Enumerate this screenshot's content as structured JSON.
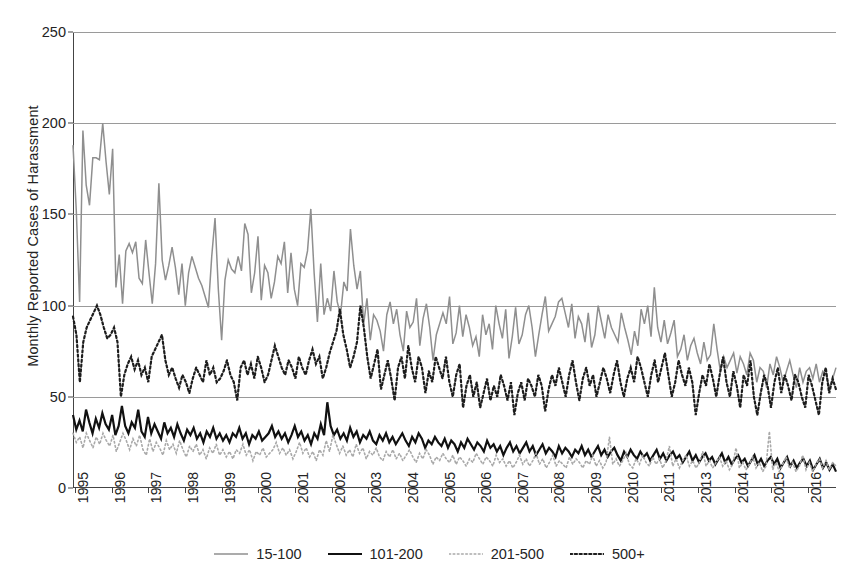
{
  "chart_data": {
    "type": "line",
    "title": "",
    "xlabel": "",
    "ylabel": "Monthly Reported Cases of Harassment",
    "ylim": [
      0,
      250
    ],
    "yticks": [
      0,
      50,
      100,
      150,
      200,
      250
    ],
    "grid": true,
    "legend_position": "bottom-center",
    "xtick_labels": [
      "1995",
      "1996",
      "1997",
      "1998",
      "1999",
      "2000",
      "2001",
      "2002",
      "2003",
      "2004",
      "2005",
      "2006",
      "2007",
      "2008",
      "2009",
      "2010",
      "2011",
      "2013",
      "2014",
      "2015",
      "2016"
    ],
    "x_start": 1995,
    "x_end": 2016.25,
    "x_unit": "month",
    "series": [
      {
        "name": "15-100",
        "color": "#8f8f8f",
        "style": "solid",
        "values": [
          188,
          152,
          102,
          196,
          166,
          155,
          181,
          181,
          180,
          200,
          179,
          161,
          186,
          110,
          128,
          101,
          130,
          134,
          129,
          135,
          115,
          112,
          136,
          118,
          101,
          123,
          167,
          125,
          114,
          122,
          132,
          121,
          106,
          123,
          100,
          118,
          127,
          121,
          115,
          111,
          105,
          99,
          127,
          148,
          109,
          81,
          114,
          125,
          120,
          118,
          127,
          119,
          145,
          139,
          107,
          118,
          138,
          103,
          122,
          118,
          104,
          113,
          127,
          123,
          135,
          107,
          129,
          109,
          100,
          123,
          121,
          130,
          153,
          118,
          91,
          123,
          95,
          104,
          97,
          119,
          102,
          95,
          113,
          108,
          142,
          122,
          109,
          119,
          90,
          104,
          81,
          95,
          92,
          86,
          75,
          95,
          102,
          90,
          98,
          84,
          75,
          97,
          88,
          91,
          104,
          78,
          93,
          101,
          88,
          70,
          84,
          90,
          96,
          90,
          105,
          79,
          85,
          100,
          83,
          95,
          88,
          78,
          83,
          72,
          95,
          84,
          90,
          76,
          100,
          90,
          82,
          98,
          71,
          83,
          99,
          79,
          84,
          95,
          100,
          88,
          72,
          84,
          95,
          105,
          86,
          90,
          94,
          102,
          104,
          96,
          88,
          101,
          82,
          94,
          90,
          80,
          96,
          77,
          84,
          100,
          91,
          82,
          95,
          88,
          84,
          80,
          96,
          88,
          81,
          73,
          86,
          78,
          98,
          90,
          100,
          83,
          110,
          88,
          80,
          92,
          79,
          85,
          92,
          72,
          76,
          84,
          70,
          78,
          82,
          74,
          68,
          80,
          70,
          73,
          90,
          76,
          64,
          72,
          66,
          70,
          74,
          63,
          72,
          68,
          62,
          74,
          70,
          58,
          66,
          64,
          55,
          68,
          62,
          72,
          66,
          58,
          64,
          70,
          62,
          55,
          66,
          58,
          64,
          66,
          60,
          68,
          58,
          64,
          62,
          55,
          60,
          66
        ]
      },
      {
        "name": "101-200",
        "color": "#111111",
        "style": "solid",
        "values": [
          40,
          32,
          37,
          31,
          43,
          36,
          30,
          38,
          33,
          41,
          35,
          32,
          40,
          29,
          34,
          45,
          34,
          30,
          36,
          33,
          43,
          31,
          28,
          39,
          30,
          35,
          31,
          27,
          36,
          30,
          33,
          28,
          35,
          30,
          26,
          32,
          29,
          33,
          27,
          30,
          25,
          31,
          28,
          33,
          27,
          30,
          26,
          29,
          25,
          30,
          28,
          33,
          27,
          30,
          24,
          29,
          27,
          31,
          26,
          28,
          30,
          34,
          28,
          31,
          27,
          30,
          25,
          29,
          34,
          28,
          31,
          26,
          29,
          24,
          30,
          27,
          35,
          29,
          47,
          34,
          29,
          32,
          27,
          30,
          26,
          33,
          28,
          31,
          25,
          29,
          27,
          31,
          26,
          24,
          29,
          26,
          30,
          25,
          28,
          24,
          27,
          30,
          26,
          23,
          28,
          25,
          30,
          27,
          22,
          26,
          24,
          28,
          25,
          23,
          27,
          22,
          26,
          24,
          20,
          25,
          22,
          27,
          24,
          21,
          25,
          23,
          20,
          26,
          22,
          24,
          20,
          23,
          18,
          22,
          25,
          20,
          23,
          19,
          22,
          25,
          20,
          23,
          18,
          21,
          24,
          19,
          22,
          20,
          17,
          23,
          19,
          22,
          20,
          17,
          21,
          19,
          23,
          18,
          21,
          17,
          20,
          23,
          18,
          21,
          17,
          20,
          22,
          18,
          15,
          20,
          17,
          21,
          18,
          16,
          20,
          17,
          19,
          15,
          18,
          21,
          16,
          19,
          15,
          18,
          20,
          16,
          18,
          14,
          17,
          20,
          15,
          18,
          14,
          17,
          19,
          15,
          17,
          13,
          16,
          19,
          14,
          17,
          13,
          16,
          18,
          14,
          16,
          12,
          15,
          18,
          13,
          16,
          12,
          15,
          17,
          13,
          16,
          11,
          14,
          17,
          12,
          15,
          11,
          14,
          16,
          12,
          15,
          10,
          13,
          16,
          11,
          14,
          10,
          13,
          9
        ]
      },
      {
        "name": "201-500",
        "color": "#a9a9a9",
        "style": "dotted",
        "values": [
          30,
          25,
          28,
          22,
          30,
          26,
          22,
          28,
          24,
          30,
          26,
          23,
          29,
          20,
          25,
          30,
          26,
          21,
          27,
          23,
          29,
          21,
          18,
          27,
          20,
          25,
          22,
          18,
          26,
          21,
          24,
          19,
          26,
          21,
          17,
          23,
          20,
          24,
          18,
          21,
          16,
          22,
          19,
          24,
          18,
          21,
          17,
          20,
          16,
          21,
          19,
          24,
          18,
          21,
          15,
          20,
          18,
          22,
          17,
          19,
          21,
          25,
          19,
          22,
          18,
          21,
          16,
          20,
          25,
          19,
          22,
          17,
          20,
          15,
          21,
          18,
          26,
          20,
          29,
          24,
          19,
          23,
          18,
          21,
          17,
          24,
          19,
          22,
          16,
          20,
          18,
          22,
          17,
          15,
          20,
          17,
          21,
          16,
          19,
          15,
          18,
          21,
          17,
          14,
          19,
          16,
          21,
          18,
          13,
          17,
          15,
          19,
          16,
          14,
          18,
          13,
          17,
          15,
          12,
          16,
          14,
          19,
          16,
          13,
          17,
          15,
          12,
          18,
          14,
          16,
          12,
          15,
          11,
          14,
          18,
          13,
          16,
          12,
          15,
          19,
          13,
          16,
          11,
          14,
          18,
          12,
          15,
          13,
          11,
          17,
          13,
          16,
          14,
          11,
          15,
          13,
          18,
          12,
          15,
          11,
          14,
          28,
          13,
          16,
          12,
          15,
          19,
          13,
          11,
          16,
          13,
          18,
          14,
          12,
          17,
          13,
          16,
          11,
          15,
          23,
          12,
          16,
          11,
          15,
          18,
          12,
          15,
          11,
          14,
          20,
          12,
          15,
          11,
          14,
          17,
          12,
          15,
          10,
          13,
          22,
          11,
          14,
          10,
          13,
          17,
          11,
          14,
          9,
          12,
          31,
          10,
          14,
          9,
          13,
          17,
          11,
          14,
          9,
          12,
          18,
          10,
          14,
          9,
          13,
          16,
          11,
          15,
          10,
          14,
          12
        ]
      },
      {
        "name": "500+",
        "color": "#1d1d1d",
        "style": "dotted",
        "values": [
          94,
          84,
          58,
          80,
          88,
          92,
          96,
          100,
          95,
          88,
          82,
          84,
          88,
          80,
          50,
          62,
          68,
          72,
          65,
          70,
          62,
          66,
          58,
          72,
          76,
          80,
          84,
          70,
          62,
          66,
          60,
          55,
          62,
          58,
          52,
          60,
          66,
          62,
          58,
          70,
          62,
          66,
          58,
          60,
          64,
          70,
          62,
          58,
          48,
          66,
          70,
          62,
          68,
          60,
          72,
          66,
          58,
          62,
          70,
          78,
          72,
          66,
          62,
          70,
          66,
          60,
          72,
          66,
          62,
          70,
          76,
          68,
          72,
          60,
          66,
          74,
          80,
          86,
          98,
          84,
          76,
          66,
          72,
          80,
          100,
          88,
          72,
          60,
          68,
          76,
          54,
          62,
          70,
          60,
          48,
          66,
          72,
          60,
          78,
          66,
          58,
          72,
          66,
          52,
          64,
          58,
          72,
          66,
          60,
          72,
          58,
          50,
          62,
          68,
          44,
          56,
          62,
          50,
          58,
          44,
          52,
          60,
          48,
          56,
          50,
          62,
          56,
          48,
          58,
          40,
          52,
          58,
          48,
          60,
          56,
          50,
          62,
          56,
          42,
          54,
          62,
          56,
          66,
          58,
          50,
          62,
          70,
          58,
          48,
          60,
          66,
          56,
          62,
          50,
          58,
          66,
          60,
          52,
          62,
          70,
          58,
          50,
          60,
          66,
          58,
          72,
          66,
          58,
          50,
          62,
          70,
          58,
          66,
          74,
          62,
          50,
          58,
          70,
          62,
          56,
          66,
          58,
          40,
          52,
          62,
          56,
          68,
          60,
          50,
          62,
          72,
          58,
          50,
          64,
          56,
          44,
          62,
          56,
          70,
          50,
          40,
          52,
          62,
          56,
          44,
          58,
          66,
          52,
          62,
          56,
          48,
          62,
          58,
          50,
          44,
          62,
          56,
          48,
          40,
          58,
          66,
          52,
          60,
          54
        ]
      }
    ]
  },
  "legend": {
    "items": [
      {
        "label": "15-100"
      },
      {
        "label": "101-200"
      },
      {
        "label": "201-500"
      },
      {
        "label": "500+"
      }
    ]
  }
}
